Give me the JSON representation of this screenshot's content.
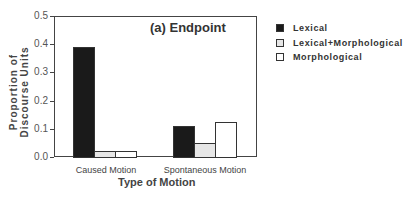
{
  "chart_data": {
    "type": "bar",
    "title": "(a) Endpoint",
    "xlabel": "Type of Motion",
    "ylabel": "Proportion of Discourse Units",
    "ylim": [
      0,
      0.5
    ],
    "yticks": [
      "0.0",
      "0.1",
      "0.2",
      "0.3",
      "0.4",
      "0.5"
    ],
    "categories": [
      "Caused Motion",
      "Spontaneous Motion"
    ],
    "series": [
      {
        "name": "Lexical",
        "color": "#1a1a1a",
        "values": [
          0.39,
          0.11
        ]
      },
      {
        "name": "Lexical+Morphological",
        "color": "#e6e6e6",
        "values": [
          0.02,
          0.05
        ]
      },
      {
        "name": "Morphological",
        "color": "#ffffff",
        "values": [
          0.02,
          0.125
        ]
      }
    ],
    "legend_position": "right",
    "grid": false
  }
}
